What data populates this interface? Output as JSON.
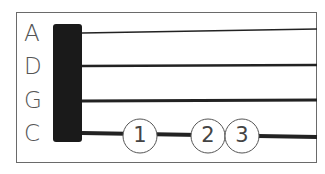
{
  "strings": [
    {
      "name": "A",
      "y": 33,
      "y_end": 28,
      "width": 1.5
    },
    {
      "name": "D",
      "y": 66,
      "y_end": 65,
      "width": 2.5
    },
    {
      "name": "G",
      "y": 101,
      "y_end": 100,
      "width": 3
    },
    {
      "name": "C",
      "y": 133,
      "y_end": 137,
      "width": 4
    }
  ],
  "fingers": [
    {
      "label": "1",
      "x": 140
    },
    {
      "label": "2",
      "x": 208
    },
    {
      "label": "3",
      "x": 242
    }
  ],
  "colors": {
    "nut": "#1a1a1a",
    "string": "#222222",
    "label": "#555555",
    "frame": "#6a6a6a"
  }
}
